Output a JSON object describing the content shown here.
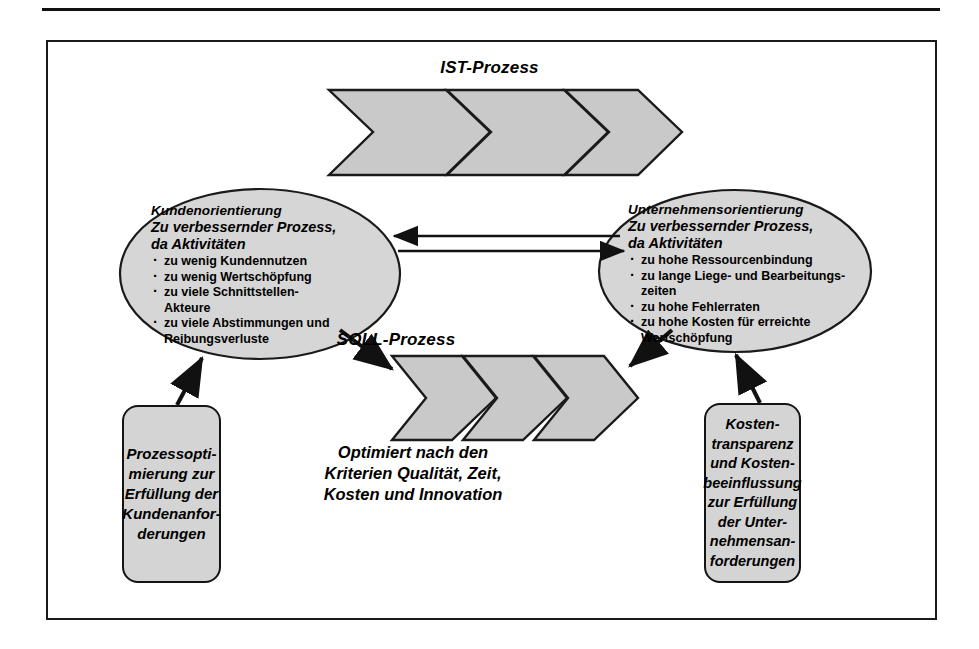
{
  "diagram": {
    "title_ist": "IST-Prozess",
    "title_soll": "SOLL-Prozess",
    "center_caption": "Optimiert nach den\nKriterien Qualität, Zeit,\nKosten und Innovation",
    "left_ellipse": {
      "heading": "Kundenorientierung",
      "subheading": "Zu verbessernder Prozess,\nda Aktivitäten",
      "bullets": [
        "zu wenig Kundennutzen",
        "zu wenig Wertschöpfung",
        "zu viele Schnittstellen-\nAkteure",
        "zu viele Abstimmungen und\nReibungsverluste"
      ]
    },
    "right_ellipse": {
      "heading": "Unternehmensorientierung",
      "subheading": "Zu  verbessernder Prozess,\nda Aktivitäten",
      "bullets": [
        "zu hohe Ressourcenbindung",
        "zu lange Liege- und Bearbeitungs-\nzeiten",
        "zu hohe Fehlerraten",
        "zu hohe Kosten für erreichte\nWertschöpfung"
      ]
    },
    "left_box": "Prozessopti-\nmierung zur\nErfüllung der\nKundenanfor-\nderungen",
    "right_box": "Kosten-\ntransparenz\nund Kosten-\nbeeinflussung\nzur Erfüllung\nder Unter-\nnehmensan-\nforderungen",
    "colors": {
      "shape_fill": "#c9c9c9",
      "box_fill": "#d4d4d4",
      "stroke": "#141414",
      "page_bg": "#ffffff"
    }
  }
}
